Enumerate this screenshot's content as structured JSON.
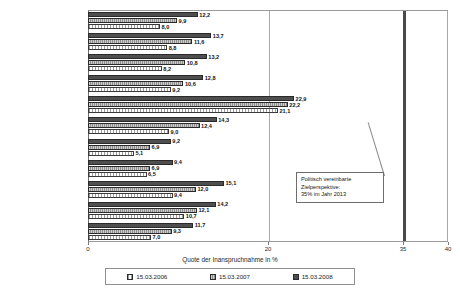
{
  "chart_data": {
    "type": "bar",
    "orientation": "horizontal",
    "title": "",
    "xlabel": "Quote der Inanspruchnahme in %",
    "ylabel": "",
    "xlim": [
      0,
      40
    ],
    "xticks": [
      0,
      20,
      35,
      40
    ],
    "xtick_labels": [
      "0",
      "20",
      "35",
      "40"
    ],
    "grid": true,
    "legend_position": "bottom",
    "categories": [
      "Westdeutschland",
      "Baden-Württemberg",
      "Bayern",
      "Bremen",
      "Hamburg",
      "Hessen",
      "Niedersachsen",
      "Nordrhein-Westfalen",
      "Rheinland-Pfalz",
      "Saarland",
      "Schleswig-Holstein"
    ],
    "series": [
      {
        "name": "15.03.2006",
        "color": "#ffffff",
        "values": [
          8.0,
          8.8,
          8.2,
          9.2,
          21.1,
          9.0,
          5.1,
          6.5,
          9.4,
          10.7,
          7.0
        ],
        "value_labels": [
          "8,0",
          "8,8",
          "8,2",
          "9,2",
          "21,1",
          "9,0",
          "5,1",
          "6,5",
          "9,4",
          "10,7",
          "7,0"
        ]
      },
      {
        "name": "15.03.2007",
        "color": "#8e8e8e",
        "values": [
          9.9,
          11.6,
          10.8,
          10.6,
          22.2,
          12.4,
          6.9,
          6.9,
          12.0,
          12.1,
          9.3
        ],
        "value_labels": [
          "9,9",
          "11,6",
          "10,8",
          "10,6",
          "22,2",
          "12,4",
          "6,9",
          "6,9",
          "12,0",
          "12,1",
          "9,3"
        ]
      },
      {
        "name": "15.03.2008",
        "color": "#4f4f4f",
        "values": [
          12.2,
          13.7,
          13.2,
          12.8,
          22.9,
          14.3,
          9.2,
          9.4,
          15.1,
          14.2,
          11.7
        ],
        "value_labels": [
          "12,2",
          "13,7",
          "13,2",
          "12,8",
          "22,9",
          "14,3",
          "9,2",
          "9,4",
          "15,1",
          "14,2",
          "11,7"
        ]
      }
    ],
    "target_line": {
      "value": 35,
      "color": "#4a4a4a"
    },
    "annotation": {
      "lines": [
        "Politisch vereinbarte",
        "Zielperspektive:",
        "35% im Jahr 2013"
      ]
    }
  },
  "legend": {
    "items": [
      {
        "label": "15.03.2006"
      },
      {
        "label": "15.03.2007"
      },
      {
        "label": "15.03.2008"
      }
    ]
  }
}
